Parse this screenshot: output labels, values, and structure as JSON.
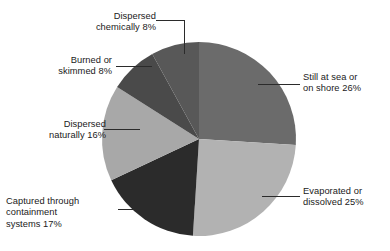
{
  "chart_data": {
    "type": "pie",
    "title": "",
    "subtitle": "",
    "xlabel": "",
    "ylabel": "",
    "legend_position": "none",
    "grid": false,
    "units": "%",
    "start_angle_deg": 0,
    "direction": "clockwise",
    "categories": [
      "Still at sea or on shore",
      "Evaporated or dissolved",
      "Captured through containment systems",
      "Dispersed naturally",
      "Burned or skimmed",
      "Dispersed chemically"
    ],
    "values": [
      26,
      25,
      17,
      16,
      8,
      8
    ],
    "colors": [
      "#6b6b6b",
      "#b2b2b2",
      "#2b2b2b",
      "#a8a8a8",
      "#4a4a4a",
      "#585858"
    ],
    "slices": [
      {
        "label": "Still at sea or\non shore 26%",
        "name": "Still at sea or on shore",
        "value": 26,
        "color": "#6b6b6b",
        "start_deg": 0,
        "end_deg": 93.6
      },
      {
        "label": "Evaporated or\ndissolved 25%",
        "name": "Evaporated or dissolved",
        "value": 25,
        "color": "#b2b2b2",
        "start_deg": 93.6,
        "end_deg": 183.6
      },
      {
        "label": "Captured through\ncontainment\nsystems 17%",
        "name": "Captured through containment systems",
        "value": 17,
        "color": "#2b2b2b",
        "start_deg": 183.6,
        "end_deg": 244.8
      },
      {
        "label": "Dispersed\nnaturally 16%",
        "name": "Dispersed naturally",
        "value": 16,
        "color": "#a8a8a8",
        "start_deg": 244.8,
        "end_deg": 302.4
      },
      {
        "label": "Burned or\nskimmed 8%",
        "name": "Burned or skimmed",
        "value": 8,
        "color": "#4a4a4a",
        "start_deg": 302.4,
        "end_deg": 331.2
      },
      {
        "label": "Dispersed\nchemically 8%",
        "name": "Dispersed chemically",
        "value": 8,
        "color": "#585858",
        "start_deg": 331.2,
        "end_deg": 360
      }
    ]
  },
  "labels": {
    "still_at_sea": "Still at sea or\non shore 26%",
    "evaporated": "Evaporated or\ndissolved 25%",
    "captured": "Captured through\ncontainment\nsystems 17%",
    "dispersed_naturally": "Dispersed\nnaturally 16%",
    "burned": "Burned or\nskimmed 8%",
    "dispersed_chemically": "Dispersed\nchemically 8%"
  },
  "style": {
    "background": "#ffffff",
    "leader_line_color": "#2b2b2b",
    "text_color": "#1a1a1a"
  }
}
